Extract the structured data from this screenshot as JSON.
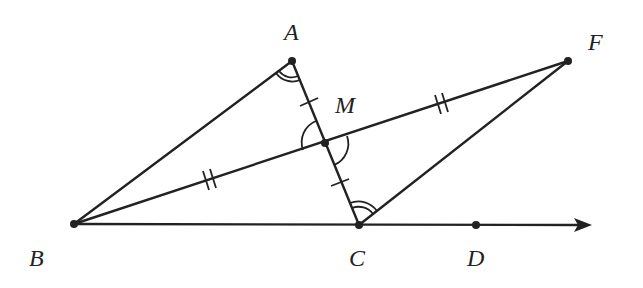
{
  "diagram": {
    "type": "geometry",
    "colors": {
      "stroke": "#222222",
      "background": "#ffffff"
    },
    "points": [
      {
        "name": "A",
        "label": "A",
        "x": 292,
        "y": 61
      },
      {
        "name": "B",
        "label": "B",
        "x": 74,
        "y": 224
      },
      {
        "name": "C",
        "label": "C",
        "x": 359,
        "y": 225
      },
      {
        "name": "D",
        "label": "D",
        "x": 476,
        "y": 225
      },
      {
        "name": "F",
        "label": "F",
        "x": 568,
        "y": 61
      },
      {
        "name": "M",
        "label": "M",
        "x": 325,
        "y": 143
      }
    ],
    "segments": [
      "AB",
      "AC",
      "BF",
      "CF",
      "BC"
    ],
    "rays": [
      {
        "from": "B",
        "through": "D"
      }
    ],
    "tick_marks": [
      {
        "segment": "AM",
        "count": 1
      },
      {
        "segment": "MC",
        "count": 1
      },
      {
        "segment": "BM",
        "count": 2
      },
      {
        "segment": "MF",
        "count": 2
      }
    ],
    "angle_marks": [
      {
        "vertex": "A",
        "between": [
          "B",
          "C"
        ],
        "arcs": 2
      },
      {
        "vertex": "C",
        "between": [
          "A",
          "F"
        ],
        "arcs": 2
      },
      {
        "vertex": "M",
        "between": [
          "A",
          "B"
        ],
        "arcs": 1
      },
      {
        "vertex": "M",
        "between": [
          "C",
          "F"
        ],
        "arcs": 1
      }
    ]
  },
  "labels": {
    "A": "A",
    "B": "B",
    "C": "C",
    "D": "D",
    "F": "F",
    "M": "M"
  }
}
